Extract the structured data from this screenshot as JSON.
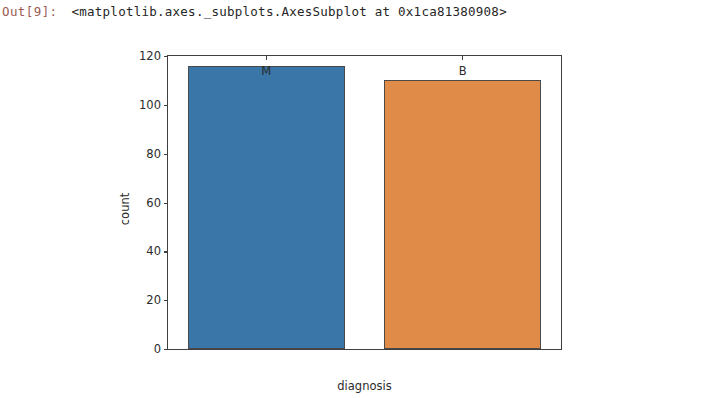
{
  "notebook": {
    "prompt": "Out[9]:",
    "repr_text": "<matplotlib.axes._subplots.AxesSubplot at 0x1ca81380908>",
    "prompt_color": "#9c5a53"
  },
  "chart_data": {
    "type": "bar",
    "title": "",
    "xlabel": "diagnosis",
    "ylabel": "count",
    "categories": [
      "M",
      "B"
    ],
    "values": [
      116,
      110
    ],
    "colors": [
      "#3a76a8",
      "#e08b47"
    ],
    "edge_color": "#4a4a4a",
    "ylim": [
      0,
      120
    ],
    "yticks": [
      0,
      20,
      40,
      60,
      80,
      100,
      120
    ],
    "ytick_labels": [
      "0",
      "20",
      "40",
      "60",
      "80",
      "100",
      "120"
    ],
    "xtick_labels": [
      "M",
      "B"
    ],
    "grid": false,
    "legend": false,
    "legend_position": "none",
    "bar_width_fraction": 0.8,
    "axes_face_color": "#ffffff",
    "figure_face_color": "#ffffff",
    "spine_color": "#3f3f3f"
  }
}
